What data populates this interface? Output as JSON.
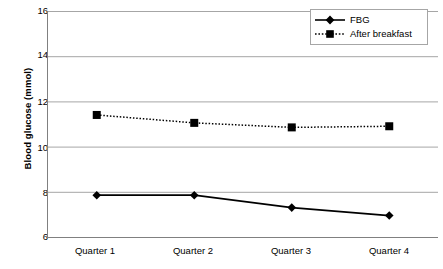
{
  "chart_data": {
    "type": "line",
    "title": "",
    "xlabel": "",
    "ylabel": "Blood glucose (mmol)",
    "categories": [
      "Quarter 1",
      "Quarter 2",
      "Quarter 3",
      "Quarter 4"
    ],
    "ylim": [
      6,
      16
    ],
    "yticks": [
      16,
      14,
      12,
      10,
      8,
      6
    ],
    "ytick_labels": [
      "16",
      "14",
      "12",
      "10",
      "8",
      "6"
    ],
    "grid": "horizontal",
    "legend_position": "top-right",
    "series": [
      {
        "name": "FBG",
        "values": [
          7.85,
          7.85,
          7.3,
          6.95
        ],
        "line_style": "solid",
        "marker": "diamond",
        "color": "#000000"
      },
      {
        "name": "After breakfast",
        "values": [
          11.4,
          11.05,
          10.85,
          10.9
        ],
        "line_style": "dotted",
        "marker": "square",
        "color": "#000000"
      }
    ]
  },
  "axes": {
    "y_title": "Blood glucose (mmol)",
    "y_labels": [
      "16",
      "14",
      "12",
      "10",
      "8",
      "6"
    ],
    "x_labels": [
      "Quarter 1",
      "Quarter 2",
      "Quarter 3",
      "Quarter 4"
    ]
  },
  "legend": {
    "entries": [
      {
        "label": "FBG"
      },
      {
        "label": "After breakfast"
      }
    ]
  },
  "colors": {
    "series": "#000000",
    "gridline": "#a6a6a6",
    "axis": "#808080",
    "background": "#ffffff"
  }
}
